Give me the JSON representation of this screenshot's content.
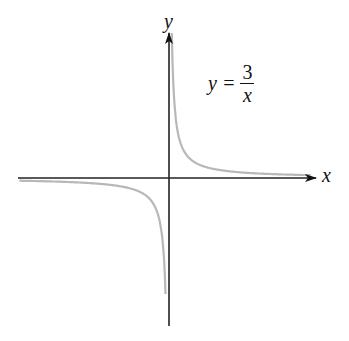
{
  "chart_data": {
    "type": "line",
    "title": "",
    "equation": {
      "lhs": "y =",
      "numerator": "3",
      "denominator": "x"
    },
    "xlabel": "x",
    "ylabel": "y",
    "grid": false,
    "legend": "none",
    "series": [
      {
        "name": "y = 3/x",
        "color": "#b8b8b8",
        "function": "3/x",
        "branches": [
          "x > 0",
          "x < 0"
        ]
      }
    ],
    "axes": {
      "color": "#222222",
      "origin_px": [
        169,
        178
      ],
      "scale_px_per_unit": 11.6,
      "xlim": [
        -13,
        13
      ],
      "ylim": [
        -12.5,
        12.5
      ]
    }
  }
}
